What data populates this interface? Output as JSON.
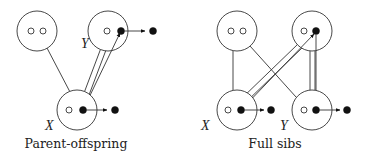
{
  "colors": {
    "stroke": "#333333",
    "filled_allele": "#111111",
    "background": "#ffffff"
  },
  "panels": [
    {
      "id": "parent-offspring",
      "caption": "Parent-offspring",
      "individuals": [
        {
          "id": "po-parent-1",
          "cx": 37,
          "cy": 31,
          "label": ""
        },
        {
          "id": "po-parent-2",
          "cx": 108,
          "cy": 31,
          "label": "Y"
        },
        {
          "id": "po-child",
          "cx": 77,
          "cy": 110,
          "label": "X"
        }
      ],
      "labels": {
        "x": "X",
        "y": "Y"
      }
    },
    {
      "id": "full-sibs",
      "caption": "Full sibs",
      "individuals": [
        {
          "id": "fs-parent-1",
          "cx": 237,
          "cy": 31,
          "label": ""
        },
        {
          "id": "fs-parent-2",
          "cx": 312,
          "cy": 31,
          "label": ""
        },
        {
          "id": "fs-sib-x",
          "cx": 237,
          "cy": 110,
          "label": "X"
        },
        {
          "id": "fs-sib-y",
          "cx": 312,
          "cy": 110,
          "label": "Y"
        }
      ],
      "labels": {
        "x": "X",
        "y": "Y"
      }
    }
  ]
}
